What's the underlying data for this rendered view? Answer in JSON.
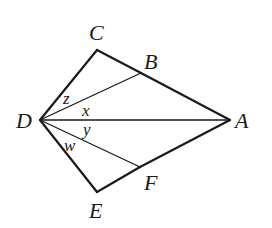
{
  "diagram": {
    "type": "geometry",
    "vertices": {
      "A": {
        "label": "A",
        "x": 230,
        "y": 120
      },
      "B": {
        "label": "B",
        "x": 141,
        "y": 73
      },
      "C": {
        "label": "C",
        "x": 97,
        "y": 50
      },
      "D": {
        "label": "D",
        "x": 40,
        "y": 120
      },
      "E": {
        "label": "E",
        "x": 97,
        "y": 192
      },
      "F": {
        "label": "F",
        "x": 140,
        "y": 167
      }
    },
    "outline_edges": [
      [
        "D",
        "C"
      ],
      [
        "C",
        "B"
      ],
      [
        "B",
        "A"
      ],
      [
        "A",
        "F"
      ],
      [
        "F",
        "E"
      ],
      [
        "E",
        "D"
      ]
    ],
    "interior_segments": [
      [
        "D",
        "B"
      ],
      [
        "D",
        "A"
      ],
      [
        "D",
        "F"
      ]
    ],
    "angle_labels": {
      "z": {
        "label": "z",
        "between": [
          "DC",
          "DB"
        ]
      },
      "x": {
        "label": "x",
        "between": [
          "DB",
          "DA"
        ]
      },
      "y": {
        "label": "y",
        "between": [
          "DA",
          "DF"
        ]
      },
      "w": {
        "label": "w",
        "between": [
          "DF",
          "DE"
        ]
      }
    },
    "stroke_color": "#1a1a1a",
    "background": "#ffffff"
  }
}
